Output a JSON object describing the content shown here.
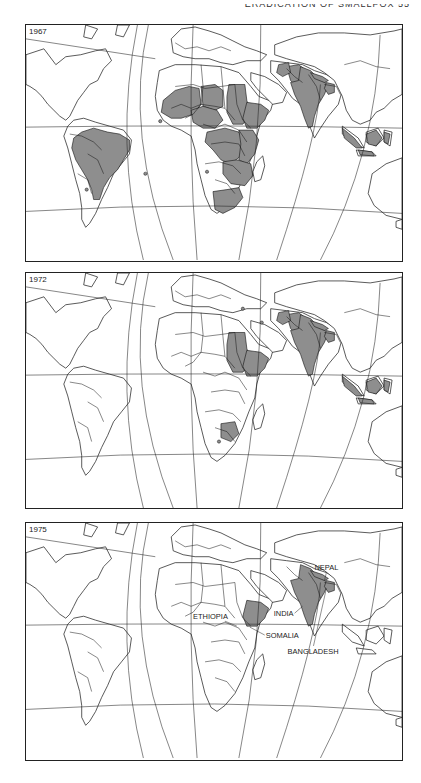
{
  "running_head": "ERADICATION OF SMALLPOX   55",
  "colors": {
    "endemic_fill": "#8e8e8e",
    "outline": "#111111",
    "background": "#ffffff"
  },
  "figure": {
    "type": "choropleth-series",
    "panels": [
      {
        "year": "1967",
        "top": 24,
        "height": 238,
        "shaded_regions": [
          "brazil",
          "west-africa",
          "sahel",
          "nigeria-cameroon",
          "sudan",
          "ethiopia",
          "central-africa",
          "east-africa",
          "southern-africa",
          "south-africa",
          "pakistan",
          "afghanistan",
          "india",
          "nepal",
          "bangladesh",
          "sumatra",
          "borneo",
          "sulawesi",
          "java"
        ],
        "dots": [
          [
            135,
            97
          ],
          [
            182,
            148
          ],
          [
            61,
            166
          ],
          [
            120,
            150
          ]
        ],
        "labels": []
      },
      {
        "year": "1972",
        "top": 272,
        "height": 237,
        "shaded_regions": [
          "sudan",
          "ethiopia",
          "botswana",
          "pakistan",
          "afghanistan",
          "india",
          "nepal",
          "bangladesh",
          "sumatra",
          "borneo",
          "sulawesi",
          "java"
        ],
        "dots": [
          [
            237,
            50
          ],
          [
            194,
            170
          ],
          [
            218,
            36
          ]
        ],
        "labels": []
      },
      {
        "year": "1975",
        "top": 522,
        "height": 239,
        "shaded_regions": [
          "ethiopia",
          "india",
          "nepal",
          "bangladesh"
        ],
        "dots": [],
        "labels": [
          {
            "text": "NEPAL",
            "x": 290,
            "y": 47,
            "lx1": 302,
            "ly1": 50,
            "lx2": 300,
            "ly2": 58
          },
          {
            "text": "INDIA",
            "x": 249,
            "y": 94,
            "lx1": 270,
            "ly1": 91,
            "lx2": 278,
            "ly2": 84
          },
          {
            "text": "ETHIOPIA",
            "x": 168,
            "y": 97,
            "lx1": 200,
            "ly1": 99,
            "lx2": 212,
            "ly2": 104
          },
          {
            "text": "SOMALIA",
            "x": 241,
            "y": 116,
            "lx1": 240,
            "ly1": 113,
            "lx2": 225,
            "ly2": 105
          },
          {
            "text": "BANGLADESH",
            "x": 263,
            "y": 132,
            "lx1": 289,
            "ly1": 124,
            "lx2": 302,
            "ly2": 66
          }
        ]
      }
    ]
  },
  "geometry": {
    "graticule": [
      "M0,14 L130,34",
      "M0,103 Q190,100 378,104",
      "M0,188 Q190,176 378,190",
      "M112,0 Q88,120 118,237",
      "M148,237 Q98,110 123,0",
      "M168,0 Q162,120 172,237",
      "M214,237 Q238,120 236,0",
      "M252,237 Q294,110 296,60",
      "M296,237 Q352,130 356,10"
    ],
    "land": [
      "M0,30 L18,24 L30,40 L40,32 L55,30 L70,26 L80,24 L86,36 L78,44 L72,56 L64,60 L58,68 L52,76 L48,84 L44,92 L40,96 L34,92 L28,86 L22,80 L16,72 L10,66 L4,62 L0,60 Z",
      "M60,0 L72,4 L66,14 L58,12 Z",
      "M92,0 L104,0 L98,12 L90,10 Z",
      "M48,96 L58,94 L70,98 L84,102 L98,106 L106,116 L104,130 L96,140 L88,150 L82,164 L76,176 L70,190 L64,200 L60,204 L56,196 L56,184 L54,170 L50,156 L46,140 L42,124 L38,112 L42,102 Z",
      "M146,14 L156,4 L170,2 L184,6 L196,10 L208,16 L220,22 L232,26 L242,30 L236,36 L222,36 L208,40 L196,38 L184,34 L170,34 L158,32 L148,28 Z",
      "M134,46 L150,40 L170,40 L196,42 L214,48 L226,62 L234,72 L244,76 L250,72 L246,86 L236,98 L232,112 L230,126 L224,140 L218,156 L210,172 L200,184 L192,190 L186,186 L180,172 L176,156 L172,140 L170,126 L166,112 L156,106 L146,102 L138,96 L132,86 L130,72 L132,58 Z",
      "M232,138 L238,132 L240,142 L236,156 L230,158 L228,148 Z",
      "M226,48 L240,52 L254,60 L262,68 L258,78 L248,80 L240,72 L232,64 L226,56 Z",
      "M246,36 L262,38 L278,40 L290,46 L302,50 L314,56 L318,66 L314,80 L304,92 L296,104 L290,114 L286,104 L282,90 L276,80 L268,74 L262,66 L254,56 L246,48 Z",
      "M250,20 L272,12 L294,8 L320,8 L346,10 L370,6 L378,4 L378,70 L368,76 L360,84 L352,88 L346,96 L336,100 L328,96 L322,86 L318,72 L310,56 L300,48 L290,42 L276,38 L262,34 L250,30 Z",
      "M318,102 L334,114 L340,124 L328,120 L318,110 Z",
      "M342,108 L354,104 L360,114 L352,122 L342,118 Z",
      "M332,126 L348,128 L352,132 L334,132 Z",
      "M360,106 L368,108 L366,122 L360,118 Z",
      "M348,150 L362,140 L378,134 L378,196 L362,192 L350,182 L344,170 Z",
      "M372,198 L378,196 L378,206 L372,204 Z"
    ],
    "borders": [
      "M150,62 L168,60 L180,64 L196,62 L210,60",
      "M176,40 L178,62 L176,80 L168,90 L160,94",
      "M196,42 L198,64 L200,84 L210,96",
      "M210,60 L212,80 L218,96 L226,104",
      "M146,84 L156,80 L166,84 L176,80 L190,82 L200,84",
      "M178,100 L190,104 L200,100 L214,106 L222,118",
      "M186,120 L200,118 L214,120 L220,132",
      "M180,140 L194,138 L208,142 L216,150",
      "M190,156 L202,160 L210,170",
      "M44,110 L56,112 L68,118 L76,126",
      "M62,130 L72,136 L78,150",
      "M52,150 L62,156 L66,170",
      "M150,18 L160,24 L172,22 L184,26 L196,22 L206,26",
      "M284,50 L292,62 L296,76",
      "M262,44 L270,52 L278,58",
      "M300,60 L312,62 L316,70",
      "M320,40 L336,36 L352,42 L366,44"
    ],
    "regions": {
      "brazil": "M56,108 L68,104 L82,108 L94,110 L104,116 L104,126 L98,136 L92,146 L84,154 L78,164 L74,176 L68,176 L66,166 L62,156 L56,146 L50,136 L46,124 L48,114 Z",
      "west-africa": "M138,76 L150,66 L164,62 L174,64 L176,80 L168,90 L156,94 L146,94 L136,88 Z",
      "sahel": "M176,62 L190,60 L198,66 L198,82 L190,86 L178,82 Z",
      "nigeria-cameroon": "M166,86 L178,82 L192,86 L198,96 L190,104 L178,104 L168,98 Z",
      "sudan": "M204,60 L220,60 L222,76 L226,90 L218,100 L208,100 L202,88 L202,72 Z",
      "ethiopia": "M222,78 L236,80 L244,86 L240,96 L232,104 L222,104 L218,94 Z",
      "central-africa": "M182,108 L200,104 L214,108 L220,118 L216,132 L206,140 L196,136 L188,126 L180,118 Z",
      "east-africa": "M214,106 L228,106 L234,116 L230,130 L222,140 L214,136 L216,120 Z",
      "southern-africa": "M198,138 L212,136 L226,140 L228,152 L220,162 L206,160 L198,150 Z",
      "botswana": "M196,152 L210,150 L214,162 L206,170 L196,166 Z",
      "south-africa": "M188,168 L202,166 L214,164 L218,174 L210,184 L198,190 L190,186 Z",
      "pakistan": "M262,42 L274,40 L282,46 L280,58 L274,64 L266,56 Z",
      "afghanistan": "M254,40 L264,38 L266,48 L258,52 L252,48 Z",
      "india": "M276,42 L286,46 L294,54 L304,60 L300,70 L294,80 L290,92 L288,102 L284,104 L280,94 L276,82 L270,70 L266,58 L274,56 Z",
      "nepal": "M286,48 L298,52 L304,56 L300,58 L290,54 Z",
      "bangladesh": "M302,58 L310,60 L310,68 L304,70 L300,64 Z",
      "sumatra": "M318,104 L330,114 L338,124 L332,124 L320,114 Z",
      "borneo": "M342,110 L352,106 L358,114 L352,122 L344,120 Z",
      "sulawesi": "M360,108 L366,110 L364,120 L360,118 Z",
      "java": "M334,126 L348,128 L350,132 L336,131 Z"
    }
  }
}
